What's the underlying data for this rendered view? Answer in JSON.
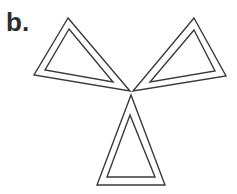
{
  "figure": {
    "label": "b.",
    "stroke_color": "#3a3a3a",
    "stroke_width": 1.4,
    "triangles": [
      {
        "name": "left",
        "outer": "68,18 34,75 130,91",
        "inner": "69,29 45,70 113,82"
      },
      {
        "name": "right",
        "outer": "194,18 226,76 133,91",
        "inner": "194,30 215,71 150,82"
      },
      {
        "name": "bottom",
        "outer": "131,95 97,185 165,185",
        "inner": "130,115 107,177 155,177"
      }
    ]
  }
}
